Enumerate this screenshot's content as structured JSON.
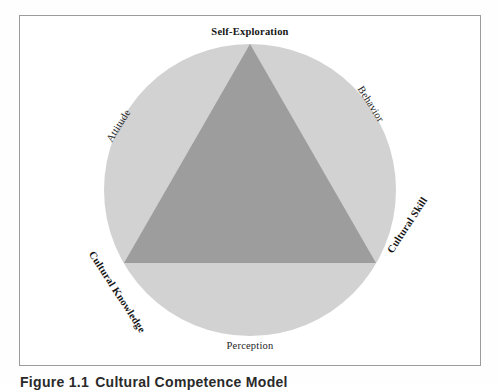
{
  "figure": {
    "caption_number": "Figure 1.1",
    "caption_title": "Cultural Competence Model"
  },
  "diagram": {
    "type": "venn-triangle-in-circle",
    "title": "Cultural Competence Model",
    "shapes": {
      "circle": {
        "name": "outer-circle",
        "fill": "#d2d2d2",
        "center_x": 250,
        "center_y": 190,
        "radius": 146
      },
      "triangle": {
        "name": "inner-triangle",
        "fill": "#9d9d9d",
        "vertices": [
          {
            "label": "Self-Exploration",
            "x": 250,
            "y": 44
          },
          {
            "label": "Cultural Knowledge",
            "x": 124,
            "y": 263
          },
          {
            "label": "Cultural Skill",
            "x": 376,
            "y": 263
          }
        ]
      }
    },
    "vertex_labels": [
      {
        "id": "self-exploration",
        "text": "Self-Exploration",
        "position": "top",
        "weight": "bold"
      },
      {
        "id": "cultural-knowledge",
        "text": "Cultural Knowledge",
        "position": "bottom-left",
        "weight": "bold"
      },
      {
        "id": "cultural-skill",
        "text": "Cultural Skill",
        "position": "bottom-right",
        "weight": "bold"
      }
    ],
    "arc_labels": [
      {
        "id": "attitude",
        "text": "Attitude",
        "position": "upper-left",
        "weight": "normal"
      },
      {
        "id": "behavior",
        "text": "Behavior",
        "position": "upper-right",
        "weight": "normal"
      },
      {
        "id": "perception",
        "text": "Perception",
        "position": "bottom",
        "weight": "normal"
      }
    ],
    "colors": {
      "circle_fill": "#d2d2d2",
      "triangle_fill": "#9d9d9d",
      "frame_border": "#9b9b9b",
      "text": "#161616",
      "background": "#ffffff"
    }
  }
}
